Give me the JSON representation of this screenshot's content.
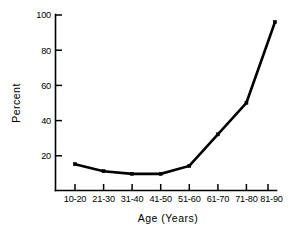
{
  "chart_data": {
    "type": "line",
    "title": "",
    "xlabel": "Age (Years)",
    "ylabel": "Percent",
    "categories": [
      "10-20",
      "21-30",
      "31-40",
      "41-50",
      "51-60",
      "61-70",
      "71-80",
      "81-90"
    ],
    "values": [
      15,
      11,
      9.5,
      9.5,
      14,
      32,
      50,
      96
    ],
    "series": [
      {
        "name": "Percent",
        "values": [
          15,
          11,
          9.5,
          9.5,
          14,
          32,
          50,
          96
        ]
      }
    ],
    "ylim": [
      0,
      100
    ],
    "ytick_labels": [
      "20",
      "40",
      "60",
      "80",
      "100"
    ],
    "ytick_values": [
      20,
      40,
      60,
      80,
      100
    ],
    "grid": false,
    "legend": false,
    "legend_position": "none",
    "line_color": "#000000",
    "marker": "square",
    "background_color": "#ffffff"
  },
  "axes": {
    "x_title": "Age (Years)",
    "y_title": "Percent"
  }
}
